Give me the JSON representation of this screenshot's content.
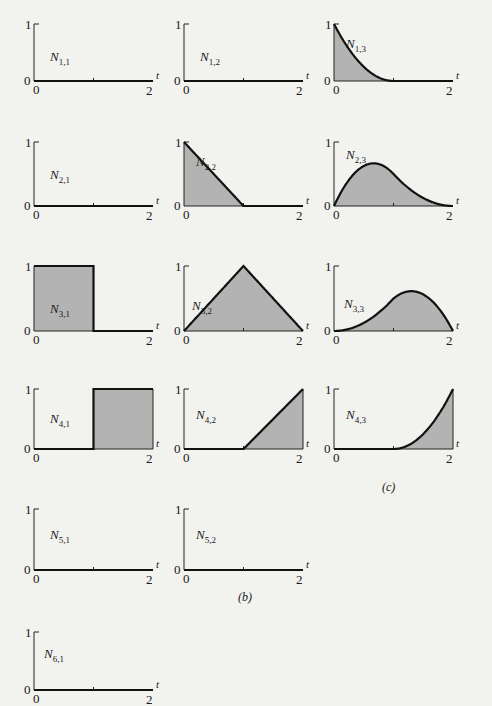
{
  "figure": {
    "panel_labels": {
      "b": "(b)",
      "c": "(c)"
    },
    "x_axis_label": "t",
    "x_ticks": [
      "0",
      "2"
    ],
    "y_ticks": [
      "0",
      "1"
    ]
  },
  "chart_data": {
    "type": "area",
    "xlabel": "t",
    "ylabel": "",
    "xlim": [
      0,
      2
    ],
    "ylim": [
      0,
      1
    ],
    "panels": [
      {
        "name": "N_{1,1}",
        "x": [
          0,
          2
        ],
        "y": [
          0,
          0
        ]
      },
      {
        "name": "N_{1,2}",
        "x": [
          0,
          2
        ],
        "y": [
          0,
          0
        ]
      },
      {
        "name": "N_{1,3}",
        "x": [
          0,
          0.25,
          0.5,
          0.75,
          1,
          2
        ],
        "y": [
          1,
          0.5625,
          0.25,
          0.0625,
          0,
          0
        ]
      },
      {
        "name": "N_{2,1}",
        "x": [
          0,
          2
        ],
        "y": [
          0,
          0
        ]
      },
      {
        "name": "N_{2,2}",
        "x": [
          0,
          1,
          2
        ],
        "y": [
          1,
          0,
          0
        ]
      },
      {
        "name": "N_{2,3}",
        "x": [
          0,
          0.5,
          0.75,
          1,
          1.5,
          2
        ],
        "y": [
          0,
          0.625,
          0.66,
          0.5,
          0.125,
          0
        ]
      },
      {
        "name": "N_{3,1}",
        "x": [
          0,
          1,
          1,
          2
        ],
        "y": [
          1,
          1,
          0,
          0
        ]
      },
      {
        "name": "N_{3,2}",
        "x": [
          0,
          1,
          2
        ],
        "y": [
          0,
          1,
          0
        ]
      },
      {
        "name": "N_{3,3}",
        "x": [
          0,
          0.5,
          1,
          1.25,
          1.5,
          2
        ],
        "y": [
          0,
          0.125,
          0.5,
          0.66,
          0.625,
          0
        ]
      },
      {
        "name": "N_{4,1}",
        "x": [
          0,
          1,
          1,
          2
        ],
        "y": [
          0,
          0,
          1,
          1
        ]
      },
      {
        "name": "N_{4,2}",
        "x": [
          0,
          1,
          2
        ],
        "y": [
          0,
          0,
          1
        ]
      },
      {
        "name": "N_{4,3}",
        "x": [
          0,
          1,
          1.25,
          1.5,
          1.75,
          2
        ],
        "y": [
          0,
          0,
          0.0625,
          0.25,
          0.5625,
          1
        ]
      },
      {
        "name": "N_{5,1}",
        "x": [
          0,
          2
        ],
        "y": [
          0,
          0
        ]
      },
      {
        "name": "N_{5,2}",
        "x": [
          0,
          2
        ],
        "y": [
          0,
          0
        ]
      },
      {
        "name": "N_{6,1}",
        "x": [
          0,
          2
        ],
        "y": [
          0,
          0
        ]
      }
    ]
  },
  "labels": [
    {
      "main": "N",
      "sub": "1,1"
    },
    {
      "main": "N",
      "sub": "1,2"
    },
    {
      "main": "N",
      "sub": "1,3"
    },
    {
      "main": "N",
      "sub": "2,1"
    },
    {
      "main": "N",
      "sub": "2,2"
    },
    {
      "main": "N",
      "sub": "2,3"
    },
    {
      "main": "N",
      "sub": "3,1"
    },
    {
      "main": "N",
      "sub": "3,2"
    },
    {
      "main": "N",
      "sub": "3,3"
    },
    {
      "main": "N",
      "sub": "4,1"
    },
    {
      "main": "N",
      "sub": "4,2"
    },
    {
      "main": "N",
      "sub": "4,3"
    },
    {
      "main": "N",
      "sub": "5,1"
    },
    {
      "main": "N",
      "sub": "5,2"
    },
    {
      "main": "N",
      "sub": "6,1"
    }
  ]
}
